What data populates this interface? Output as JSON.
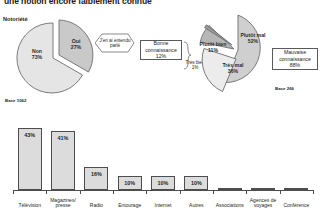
{
  "title": "une notion encore faiblement connue",
  "notoriete_label": "Notoriété",
  "pies": {
    "left": {
      "name": "notoriete-pie",
      "base_label": "Base 1062",
      "slices": [
        {
          "label": "Non",
          "value": "73%",
          "pct": 73,
          "color": "#e3e3e3"
        },
        {
          "label": "Oui",
          "value": "27%",
          "pct": 27,
          "color": "#c9c9c9"
        }
      ]
    },
    "right": {
      "name": "connaissance-pie",
      "base_label": "Base 266",
      "slices": [
        {
          "label": "Plutôt mal",
          "value": "52%",
          "pct": 52,
          "color": "#cfcfcf"
        },
        {
          "label": "Très mal",
          "value": "36%",
          "pct": 36,
          "color": "#e8e8e8"
        },
        {
          "label": "Plutôt bien",
          "value": "11%",
          "pct": 11,
          "color": "#b4b4b4"
        },
        {
          "label": "Très bien",
          "value": "1%",
          "pct": 1,
          "color": "#9a9a9a"
        }
      ]
    }
  },
  "callouts": {
    "entendu_parle": "J'en ai entendu parlé",
    "bonne_connaissance": {
      "label": "Bonne connaissance",
      "value": "12%"
    },
    "tres_bien": {
      "label": "Très bien",
      "value": "1%"
    },
    "mauvaise_connaissance": {
      "label": "Mauvaise connaissance",
      "value": "88%"
    }
  },
  "chart_data": {
    "type": "bar",
    "title": "",
    "xlabel": "",
    "ylabel": "",
    "ylim": [
      0,
      50
    ],
    "grid": false,
    "legend": "none",
    "base_label": "Base 1062",
    "categories": [
      "Télévision",
      "Magazines/ presse",
      "Radio",
      "Entourage",
      "Internet",
      "Autres",
      "Associations",
      "Agences de voyages",
      "Conférence"
    ],
    "values": [
      43,
      41,
      16,
      10,
      10,
      10,
      1,
      1,
      1
    ],
    "value_labels": [
      "43%",
      "41%",
      "16%",
      "10%",
      "10%",
      "10%",
      "",
      "",
      ""
    ]
  }
}
